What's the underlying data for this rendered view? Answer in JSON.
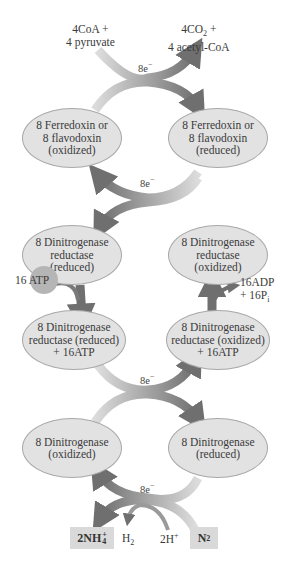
{
  "top": {
    "inputs": "4CoA +\n4 pyruvate",
    "inputs_line1": "4CoA +",
    "inputs_line2": "4 pyruvate",
    "outputs_line1": "4CO",
    "outputs_line1_sub": "2",
    "outputs_line1_tail": " +",
    "outputs_line2": "4 acetyl-CoA",
    "electrons": "8e"
  },
  "ferredoxin": {
    "oxidized": [
      "8 Ferredoxin or",
      "8 flavodoxin",
      "(oxidized)"
    ],
    "reduced": [
      "8 Ferredoxin or",
      "8 flavodoxin",
      "(reduced)"
    ],
    "electrons": "8e"
  },
  "reductase": {
    "reduced": [
      "8 Dinitrogenase",
      "reductase",
      "(reduced)"
    ],
    "oxidized": [
      "8 Dinitrogenase",
      "reductase",
      "(oxidized)"
    ],
    "atp_in": "16 ATP",
    "adp_out_line1": "16ADP",
    "adp_out_line2": "+ 16P",
    "adp_out_sub": "i"
  },
  "reductase_atp": {
    "reduced": [
      "8 Dinitrogenase",
      "reductase (reduced)",
      "+ 16ATP"
    ],
    "oxidized": [
      "8 Dinitrogenase",
      "reductase (oxidized)",
      "+ 16ATP"
    ],
    "electrons": "8e"
  },
  "dinitrogenase": {
    "oxidized": [
      "8 Dinitrogenase",
      "(oxidized)"
    ],
    "reduced": [
      "8 Dinitrogenase",
      "(reduced)"
    ],
    "electrons": "8e"
  },
  "bottom": {
    "ammonium": "2NH",
    "ammonium_sub": "4",
    "ammonium_sup": "+",
    "hydrogen": "H",
    "hydrogen_sub": "2",
    "protons": "2H",
    "protons_sup": "+",
    "nitrogen": "N",
    "nitrogen_sub": "2"
  },
  "electron_sup": "−",
  "colors": {
    "ellipse_fill": "#e2e2e2",
    "ellipse_stroke": "#a8a8a8",
    "arrow_dark": "#7a7a7a",
    "arrow_light": "#d4d4d4",
    "box_fill": "#d9d9d9"
  }
}
